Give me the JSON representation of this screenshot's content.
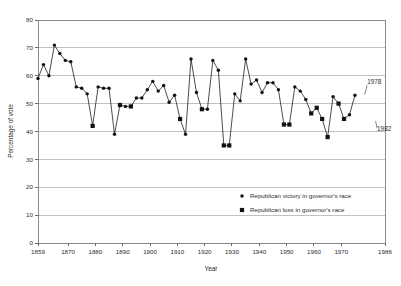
{
  "chart_data": {
    "type": "line",
    "title": "",
    "subtitle": "",
    "xlabel": "Year",
    "ylabel": "Percentage of vote",
    "xlim": [
      1859,
      1986
    ],
    "ylim": [
      0,
      80
    ],
    "grid": true,
    "grid_axis": "y",
    "legend_position": "inside-lower-right",
    "xticks": [
      1859,
      1870,
      1880,
      1890,
      1900,
      1910,
      1920,
      1930,
      1940,
      1950,
      1960,
      1970,
      1986
    ],
    "xtick_labels": [
      "1859",
      "1870",
      "1880",
      "1890",
      "1900",
      "1910",
      "1920",
      "1930",
      "1940",
      "1950",
      "1960",
      "1970",
      "1986"
    ],
    "yticks": [
      0,
      10,
      20,
      30,
      40,
      50,
      60,
      70,
      80
    ],
    "ytick_labels": [
      "0",
      "10",
      "20",
      "30",
      "40",
      "50",
      "60",
      "70",
      "80"
    ],
    "legend": [
      {
        "label": "Republican victory in governor's race",
        "marker": "circle"
      },
      {
        "label": "Republican loss in governor's race",
        "marker": "square"
      }
    ],
    "annotations": [
      {
        "text": "1978",
        "x": 1978,
        "y": 52.5,
        "dx": 4,
        "dy": -13
      },
      {
        "text": "1982",
        "x": 1982,
        "y": 44.5,
        "dx": 3,
        "dy": 12
      }
    ],
    "points": [
      {
        "x": 1859,
        "y": 59.0,
        "marker": "circle"
      },
      {
        "x": 1861,
        "y": 64.0,
        "marker": "circle"
      },
      {
        "x": 1863,
        "y": 60.0,
        "marker": "circle"
      },
      {
        "x": 1865,
        "y": 71.0,
        "marker": "circle"
      },
      {
        "x": 1867,
        "y": 68.0,
        "marker": "circle"
      },
      {
        "x": 1869,
        "y": 65.5,
        "marker": "circle"
      },
      {
        "x": 1871,
        "y": 65.0,
        "marker": "circle"
      },
      {
        "x": 1873,
        "y": 56.0,
        "marker": "circle"
      },
      {
        "x": 1875,
        "y": 55.5,
        "marker": "circle"
      },
      {
        "x": 1877,
        "y": 53.5,
        "marker": "circle"
      },
      {
        "x": 1879,
        "y": 42.0,
        "marker": "square"
      },
      {
        "x": 1881,
        "y": 56.0,
        "marker": "circle"
      },
      {
        "x": 1883,
        "y": 55.5,
        "marker": "circle"
      },
      {
        "x": 1885,
        "y": 55.5,
        "marker": "circle"
      },
      {
        "x": 1887,
        "y": 39.0,
        "marker": "circle"
      },
      {
        "x": 1889,
        "y": 49.5,
        "marker": "square"
      },
      {
        "x": 1891,
        "y": 49.0,
        "marker": "circle"
      },
      {
        "x": 1893,
        "y": 49.0,
        "marker": "square"
      },
      {
        "x": 1895,
        "y": 52.0,
        "marker": "circle"
      },
      {
        "x": 1897,
        "y": 52.0,
        "marker": "circle"
      },
      {
        "x": 1899,
        "y": 55.0,
        "marker": "circle"
      },
      {
        "x": 1901,
        "y": 58.0,
        "marker": "circle"
      },
      {
        "x": 1903,
        "y": 54.5,
        "marker": "circle"
      },
      {
        "x": 1905,
        "y": 56.5,
        "marker": "circle"
      },
      {
        "x": 1907,
        "y": 50.5,
        "marker": "circle"
      },
      {
        "x": 1909,
        "y": 53.0,
        "marker": "circle"
      },
      {
        "x": 1911,
        "y": 44.5,
        "marker": "square"
      },
      {
        "x": 1913,
        "y": 39.0,
        "marker": "circle"
      },
      {
        "x": 1915,
        "y": 66.0,
        "marker": "circle"
      },
      {
        "x": 1917,
        "y": 54.0,
        "marker": "circle"
      },
      {
        "x": 1919,
        "y": 48.0,
        "marker": "square"
      },
      {
        "x": 1921,
        "y": 48.0,
        "marker": "circle"
      },
      {
        "x": 1923,
        "y": 65.5,
        "marker": "circle"
      },
      {
        "x": 1925,
        "y": 62.0,
        "marker": "circle"
      },
      {
        "x": 1927,
        "y": 35.0,
        "marker": "square"
      },
      {
        "x": 1929,
        "y": 35.0,
        "marker": "square"
      },
      {
        "x": 1931,
        "y": 53.5,
        "marker": "circle"
      },
      {
        "x": 1933,
        "y": 51.0,
        "marker": "circle"
      },
      {
        "x": 1935,
        "y": 66.0,
        "marker": "circle"
      },
      {
        "x": 1937,
        "y": 57.0,
        "marker": "circle"
      },
      {
        "x": 1939,
        "y": 58.5,
        "marker": "circle"
      },
      {
        "x": 1941,
        "y": 54.0,
        "marker": "circle"
      },
      {
        "x": 1943,
        "y": 57.5,
        "marker": "circle"
      },
      {
        "x": 1945,
        "y": 57.5,
        "marker": "circle"
      },
      {
        "x": 1947,
        "y": 55.0,
        "marker": "circle"
      },
      {
        "x": 1949,
        "y": 42.5,
        "marker": "square"
      },
      {
        "x": 1951,
        "y": 42.5,
        "marker": "square"
      },
      {
        "x": 1953,
        "y": 56.0,
        "marker": "circle"
      },
      {
        "x": 1955,
        "y": 54.5,
        "marker": "circle"
      },
      {
        "x": 1957,
        "y": 51.5,
        "marker": "circle"
      },
      {
        "x": 1959,
        "y": 46.5,
        "marker": "square"
      },
      {
        "x": 1961,
        "y": 48.5,
        "marker": "square"
      },
      {
        "x": 1963,
        "y": 44.5,
        "marker": "square"
      },
      {
        "x": 1965,
        "y": 38.0,
        "marker": "square"
      },
      {
        "x": 1967,
        "y": 52.5,
        "marker": "circle"
      },
      {
        "x": 1969,
        "y": 50.0,
        "marker": "square"
      },
      {
        "x": 1971,
        "y": 44.5,
        "marker": "square"
      },
      {
        "x": 1973,
        "y": 46.0,
        "marker": "circle"
      },
      {
        "x": 1975,
        "y": 53.0,
        "marker": "circle"
      }
    ]
  },
  "geometry": {
    "plot_left": 38,
    "plot_right": 385,
    "plot_top": 20,
    "plot_bottom": 243
  }
}
